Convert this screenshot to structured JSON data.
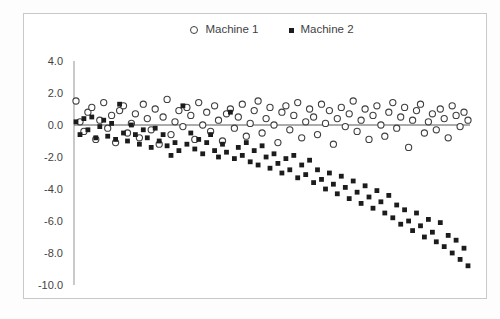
{
  "page": {
    "background": "#fdfdfd"
  },
  "chart_data": {
    "type": "scatter",
    "title": "",
    "xlabel": "",
    "ylabel": "",
    "x": {
      "start": 1,
      "step": 1,
      "count": 100
    },
    "ylim": [
      -10.0,
      4.0
    ],
    "yticks": [
      4.0,
      2.0,
      0.0,
      -2.0,
      -4.0,
      -6.0,
      -8.0,
      -10.0
    ],
    "ytick_labels": [
      "4.0",
      "2.0",
      "0.0",
      "-2.0",
      "-4.0",
      "-6.0",
      "-8.0",
      "-10.0"
    ],
    "xtick_labels_visible": false,
    "grid": false,
    "zero_line": true,
    "legend_position": "top-center",
    "colors": {
      "machine1_stroke": "#3f3f3f",
      "machine1_fill": "#ffffff",
      "machine2_fill": "#1c1c1c",
      "axis_line": "#a6a6a6",
      "zero_line": "#595959",
      "tick_text": "#3f3f3f",
      "frame_border": "#c9c9c9",
      "plot_background": "#ffffff"
    },
    "series": [
      {
        "name": "Machine 1",
        "marker": "circle",
        "values": [
          1.5,
          0.2,
          -0.4,
          0.8,
          1.1,
          -0.9,
          0.3,
          1.4,
          -0.2,
          0.6,
          -1.1,
          0.9,
          1.2,
          -0.5,
          0.1,
          0.7,
          -0.8,
          1.3,
          0.4,
          -0.3,
          1.0,
          -1.2,
          0.5,
          1.6,
          -0.6,
          0.2,
          0.9,
          -0.1,
          1.1,
          0.6,
          -0.9,
          1.4,
          0.0,
          0.8,
          -0.4,
          1.2,
          0.3,
          -1.0,
          0.7,
          1.0,
          -0.2,
          0.5,
          1.3,
          -0.7,
          0.1,
          0.9,
          1.5,
          -0.5,
          0.4,
          1.1,
          0.0,
          -1.1,
          0.8,
          1.2,
          -0.3,
          0.6,
          1.4,
          -0.8,
          0.2,
          1.0,
          0.5,
          -0.6,
          1.3,
          0.1,
          0.9,
          -1.2,
          0.4,
          1.1,
          -0.1,
          0.7,
          1.5,
          -0.4,
          0.3,
          1.0,
          -0.9,
          0.6,
          1.2,
          0.0,
          -0.7,
          0.8,
          1.4,
          -0.2,
          0.5,
          1.1,
          -1.4,
          0.3,
          0.9,
          1.3,
          -0.5,
          0.2,
          0.7,
          -0.3,
          1.0,
          0.4,
          -0.8,
          1.2,
          0.6,
          -0.1,
          0.8,
          0.3
        ]
      },
      {
        "name": "Machine 2",
        "marker": "square",
        "values": [
          0.2,
          -0.6,
          0.4,
          -0.3,
          0.5,
          -0.8,
          -0.1,
          0.3,
          -0.7,
          0.1,
          -0.9,
          1.3,
          -0.5,
          -1.0,
          0.0,
          -0.6,
          -1.2,
          -0.3,
          -0.8,
          -1.4,
          -0.2,
          -1.0,
          -0.6,
          -1.3,
          -1.9,
          -1.1,
          -1.6,
          1.2,
          -1.2,
          -0.5,
          -1.5,
          -0.9,
          -1.8,
          -1.1,
          -0.6,
          -1.6,
          -2.0,
          -1.2,
          -1.7,
          0.8,
          -2.1,
          -1.4,
          -1.9,
          -1.1,
          -2.3,
          -1.6,
          -2.5,
          -1.3,
          -2.0,
          -2.7,
          -1.8,
          -2.4,
          -3.0,
          -2.1,
          -2.8,
          -1.9,
          -3.3,
          -2.5,
          -3.1,
          -2.2,
          -3.6,
          -2.8,
          -3.4,
          -4.0,
          -3.0,
          -3.7,
          -4.3,
          -3.2,
          -3.9,
          -4.6,
          -3.5,
          -4.2,
          -4.9,
          -3.8,
          -4.5,
          -5.2,
          -4.1,
          -4.8,
          -5.5,
          -4.4,
          -5.8,
          -5.0,
          -6.2,
          -5.3,
          -6.0,
          -6.6,
          -5.5,
          -6.3,
          -7.0,
          -5.9,
          -6.7,
          -7.3,
          -6.1,
          -7.6,
          -6.9,
          -8.0,
          -7.2,
          -8.4,
          -7.7,
          -8.8
        ]
      }
    ]
  }
}
